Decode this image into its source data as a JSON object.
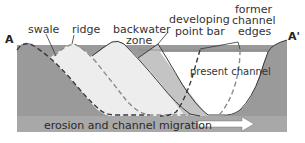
{
  "diagram": {
    "end_labels": {
      "left": "A",
      "right": "A'"
    },
    "labels": {
      "swale": "swale",
      "ridge": "ridge",
      "backwater_zone_1": "backwater",
      "backwater_zone_2": "zone",
      "developing_point_bar_1": "developing",
      "developing_point_bar_2": "point bar",
      "former_channel_edges_1": "former",
      "former_channel_edges_2": "channel",
      "former_channel_edges_3": "edges",
      "present_channel": "present channel"
    },
    "bottom_caption": "erosion and channel migration",
    "arrow_direction": "right",
    "colors": {
      "bedrock_dark": "#9a9a9a",
      "old_deposit_light": "#ededed",
      "point_bar_mid": "#c4c4c4",
      "water_line": "#888888",
      "outline": "#3a3a3a",
      "dashed_outline": "#8c8c8c",
      "arrow_fill": "#ffffff"
    }
  }
}
